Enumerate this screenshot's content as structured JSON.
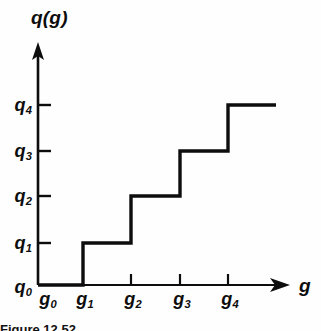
{
  "figure": {
    "kind": "step-function-plot",
    "background_color": "#fefefe",
    "ink_color": "#0d0d0d",
    "caption_text": "Figure 12.52"
  },
  "axes": {
    "y_title": "q(g)",
    "x_title": "g",
    "y_axis_x_px": 38,
    "x_axis_y_px": 285,
    "y_arrow_tip_y_px": 42,
    "x_arrow_tip_x_px": 290,
    "tick_length_px": 9,
    "line_width_px": 2.6,
    "curve_width_px": 3.4
  },
  "y_ticks": [
    {
      "label_main": "q",
      "label_sub": "4",
      "y_px": 105,
      "has_tick_mark": true
    },
    {
      "label_main": "q",
      "label_sub": "3",
      "y_px": 151,
      "has_tick_mark": true
    },
    {
      "label_main": "q",
      "label_sub": "2",
      "y_px": 196,
      "has_tick_mark": true
    },
    {
      "label_main": "q",
      "label_sub": "1",
      "y_px": 243,
      "has_tick_mark": true
    },
    {
      "label_main": "q",
      "label_sub": "0",
      "y_px": 285,
      "has_tick_mark": false
    }
  ],
  "x_ticks": [
    {
      "label_main": "g",
      "label_sub": "0",
      "x_px": 48,
      "has_tick_mark": false
    },
    {
      "label_main": "g",
      "label_sub": "1",
      "x_px": 83,
      "has_tick_mark": false
    },
    {
      "label_main": "g",
      "label_sub": "2",
      "x_px": 131,
      "has_tick_mark": true
    },
    {
      "label_main": "g",
      "label_sub": "3",
      "x_px": 180,
      "has_tick_mark": true
    },
    {
      "label_main": "g",
      "label_sub": "4",
      "x_px": 228,
      "has_tick_mark": true
    }
  ],
  "chart_data": {
    "type": "line",
    "subtype": "staircase-step-post",
    "title": "",
    "xlabel": "g",
    "ylabel": "q(g)",
    "grid": false,
    "legend": null,
    "x_categories": [
      "g0",
      "g1",
      "g2",
      "g3",
      "g4"
    ],
    "y_categories": [
      "q0",
      "q1",
      "q2",
      "q3",
      "q4"
    ],
    "x_tick_labels": [
      "g₀",
      "g₁",
      "g₂",
      "g₃",
      "g₄"
    ],
    "y_tick_labels": [
      "q₀",
      "q₁",
      "q₂",
      "q₃",
      "q₄"
    ],
    "steps": [
      {
        "x_start": "g0",
        "x_end": "g1",
        "y": "q0"
      },
      {
        "x_start": "g1",
        "x_end": "g2",
        "y": "q1"
      },
      {
        "x_start": "g2",
        "x_end": "g3",
        "y": "q2"
      },
      {
        "x_start": "g3",
        "x_end": "g4",
        "y": "q3"
      },
      {
        "x_start": "g4",
        "x_end": "end",
        "y": "q4"
      }
    ],
    "polyline_px": [
      [
        38,
        285
      ],
      [
        83,
        285
      ],
      [
        83,
        243
      ],
      [
        131,
        243
      ],
      [
        131,
        196
      ],
      [
        180,
        196
      ],
      [
        180,
        151
      ],
      [
        228,
        151
      ],
      [
        228,
        105
      ],
      [
        276,
        105
      ]
    ],
    "x_index_values": [
      0,
      1,
      2,
      3,
      4
    ],
    "y_index_values": [
      0,
      1,
      2,
      3,
      4
    ],
    "xlim_px": [
      38,
      290
    ],
    "ylim_px": [
      285,
      42
    ]
  }
}
